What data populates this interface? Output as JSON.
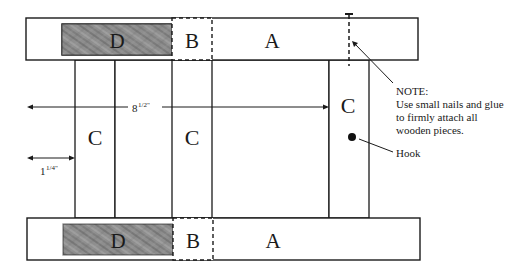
{
  "pieces": {
    "top": {
      "d": "D",
      "b": "B",
      "a": "A"
    },
    "bottom": {
      "d": "D",
      "b": "B",
      "a": "A"
    },
    "c_left": "C",
    "c_mid": "C",
    "c_right": "C"
  },
  "dimensions": {
    "width_main": "8",
    "width_main_frac": "1/2\"",
    "width_small": "1",
    "width_small_frac": "1/4\""
  },
  "note": {
    "heading": "NOTE:",
    "lines": [
      "Use small nails and glue",
      "to firmly attach all",
      "wooden pieces."
    ]
  },
  "hook_label": "Hook",
  "colors": {
    "wood_fill": "#8c8c8c",
    "line": "#1a1a1a"
  }
}
